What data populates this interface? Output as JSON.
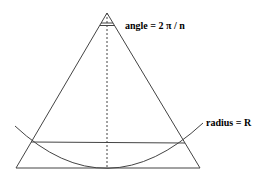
{
  "diagram": {
    "labels": {
      "angle": "angle = 2 π / n",
      "radius": "radius = R"
    },
    "colors": {
      "stroke": "#444444",
      "background": "#ffffff"
    }
  }
}
